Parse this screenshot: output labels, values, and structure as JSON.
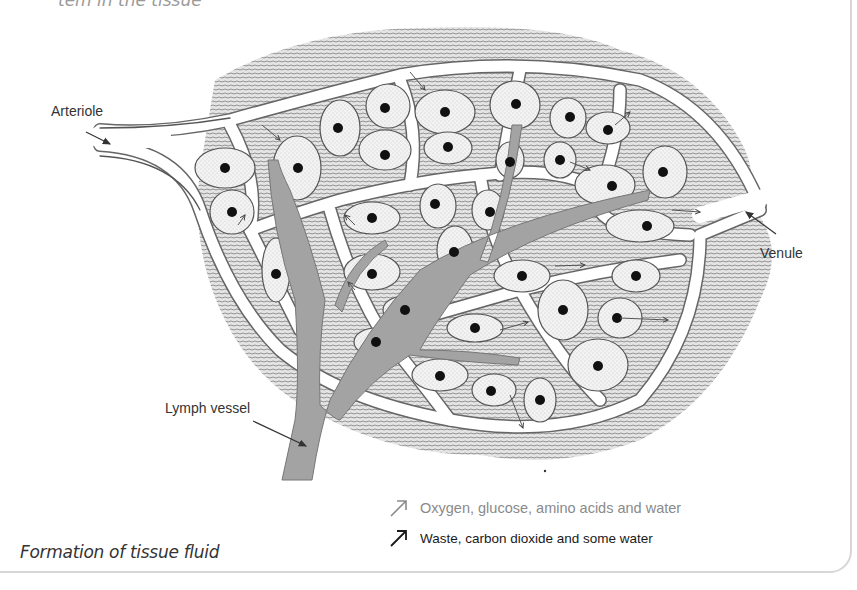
{
  "header": {
    "cut_off_heading": "tem in the tissue"
  },
  "diagram": {
    "labels": {
      "arteriole": "Arteriole",
      "venule": "Venule",
      "lymph_vessel": "Lymph vessel"
    },
    "colors": {
      "tissue_hatch": "#9a9a9a",
      "capillary": "#ffffff",
      "cell_fill": "#ededed",
      "nucleus": "#111111",
      "lymph": "#9e9e9e",
      "outline": "#555555"
    }
  },
  "legend": {
    "items": [
      {
        "icon": "arrow-up-right-light-icon",
        "label": "Oxygen, glucose, amino acids and water",
        "color": "#8a8a8a"
      },
      {
        "icon": "arrow-up-right-dark-icon",
        "label": "Waste, carbon dioxide and some water",
        "color": "#1a1a1a"
      }
    ]
  },
  "caption": "Formation of tissue fluid"
}
